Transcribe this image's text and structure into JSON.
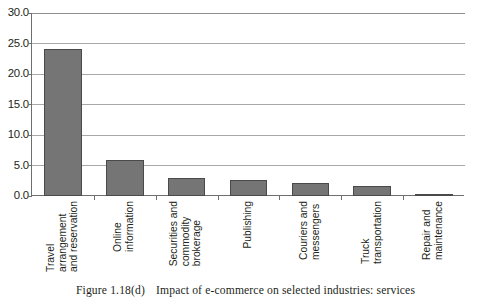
{
  "figure": {
    "caption_number": "Figure 1.18(d)",
    "caption_text": "Impact of e-commerce on selected industries: services"
  },
  "colors": {
    "bar_fill": "#757575",
    "bar_stroke": "#4a4a4a",
    "gridline": "#a8a8a8",
    "axis": "#6e6e6e",
    "text": "#231f20",
    "background": "#ffffff"
  },
  "chart_data": {
    "type": "bar",
    "title": "Impact of e-commerce on selected industries: services",
    "xlabel": "",
    "ylabel": "",
    "ylim": [
      0,
      30
    ],
    "ytick_labels": [
      "0.0",
      "5.0",
      "10.0",
      "15.0",
      "20.0",
      "25.0",
      "30.0"
    ],
    "ytick_values": [
      0,
      5,
      10,
      15,
      20,
      25,
      30
    ],
    "grid": true,
    "legend": "none",
    "categories": [
      "Travel\narrangement\nand reservation",
      "Online\ninformation",
      "Securities and\ncommodity\nbrokerage",
      "Publishing",
      "Couriers and\nmessengers",
      "Truck\ntransportation",
      "Repair and\nmaintenance"
    ],
    "values": [
      24.1,
      5.9,
      2.9,
      2.6,
      2.1,
      1.6,
      0.3
    ]
  }
}
